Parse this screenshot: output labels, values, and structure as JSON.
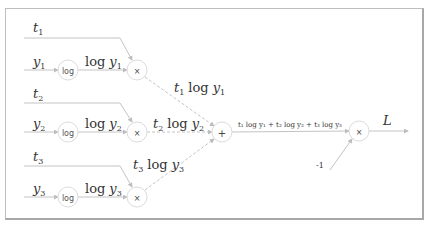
{
  "diagram": {
    "type": "computational-graph",
    "inputs": [
      {
        "id": "t1",
        "label": "t",
        "sub": "1"
      },
      {
        "id": "y1",
        "label": "y",
        "sub": "1"
      },
      {
        "id": "t2",
        "label": "t",
        "sub": "2"
      },
      {
        "id": "y2",
        "label": "y",
        "sub": "2"
      },
      {
        "id": "t3",
        "label": "t",
        "sub": "3"
      },
      {
        "id": "y3",
        "label": "y",
        "sub": "3"
      }
    ],
    "nodes": {
      "log1": "log",
      "log2": "log",
      "log3": "log",
      "mul1": "×",
      "mul2": "×",
      "mul3": "×",
      "add": "+",
      "mul_final": "×"
    },
    "edge_labels": {
      "log_y1": {
        "fn": "log",
        "var": "y",
        "sub": "1"
      },
      "log_y2": {
        "fn": "log",
        "var": "y",
        "sub": "2"
      },
      "log_y3": {
        "fn": "log",
        "var": "y",
        "sub": "3"
      },
      "t1_log_y1": {
        "t": "t",
        "tsub": "1",
        "fn": "log",
        "var": "y",
        "sub": "1"
      },
      "t2_log_y2": {
        "t": "t",
        "tsub": "2",
        "fn": "log",
        "var": "y",
        "sub": "2"
      },
      "t3_log_y3": {
        "t": "t",
        "tsub": "3",
        "fn": "log",
        "var": "y",
        "sub": "3"
      },
      "sum": "t₁ log y₁ + t₂ log y₂ + t₃ log y₃",
      "neg_one": "-1",
      "output": "L"
    }
  }
}
